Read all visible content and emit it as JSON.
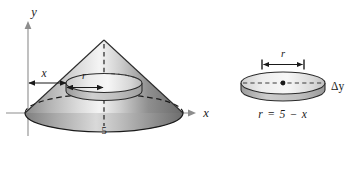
{
  "figure": {
    "type": "math-diagram",
    "background_color": "#ffffff",
    "ink_color": "#1a1a1a"
  },
  "axes": {
    "y_axis_label": "y",
    "x_axis_label": "x",
    "x_tick_label": "5",
    "origin_px": {
      "x": 28,
      "y": 113
    },
    "x_axis_end_px": 197,
    "y_axis_top_px": 22
  },
  "cone": {
    "apex_label": "",
    "base_tick_value": "5",
    "fill_light": "#f2f2f2",
    "fill_mid": "#b8b8b8",
    "fill_dark": "#6e6e6e",
    "outline_color": "#2b2b2b",
    "apex_px": {
      "x": 104,
      "y": 40
    },
    "base_center_px": {
      "x": 104,
      "y": 113
    },
    "base_radius_px": 79,
    "base_ellipse_ry_px": 19
  },
  "dimensions": {
    "x_distance_label": "x",
    "r_radius_label": "r"
  },
  "disk_detail": {
    "radius_label": "r",
    "thickness_label": "Δy",
    "equation_label": "r = 5 − x",
    "center_px": {
      "x": 283,
      "y": 83
    },
    "rx_px": 42,
    "ry_px": 11,
    "thickness_px": 9,
    "fill_top": "#e8e8e8",
    "fill_side": "#bdbdbd",
    "outline_color": "#2b2b2b"
  }
}
